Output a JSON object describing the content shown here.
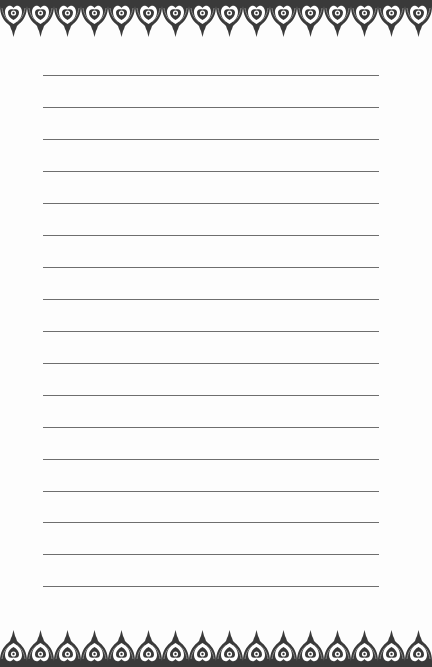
{
  "document": {
    "type": "lined-stationery-page",
    "background_color": "#fdfdfd",
    "border": {
      "style": "ornamental-paisley-scallop",
      "color": "#3a3a3a",
      "motif_count": 16,
      "motif_pitch_px": 27,
      "positions": [
        "top",
        "bottom"
      ]
    },
    "ruled_lines": {
      "count": 17,
      "color": "#6e6e6e",
      "x_start": 43,
      "x_end": 379,
      "y_positions": [
        75,
        107,
        139,
        171,
        203,
        235,
        267,
        299,
        331,
        363,
        395,
        427,
        459,
        491,
        522,
        554,
        586
      ]
    }
  }
}
